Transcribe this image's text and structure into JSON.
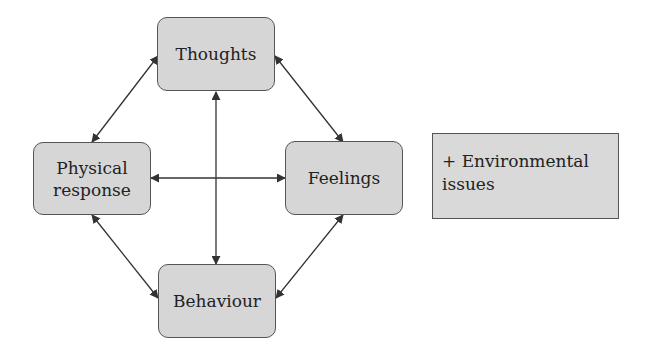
{
  "diagram": {
    "nodes": {
      "thoughts": {
        "label": "Thoughts"
      },
      "physical": {
        "label_line1": "Physical",
        "label_line2": "response"
      },
      "feelings": {
        "label": "Feelings"
      },
      "behaviour": {
        "label": "Behaviour"
      }
    },
    "side_note": {
      "line1": "+ Environmental",
      "line2": "issues"
    },
    "edges": [
      {
        "from": "Thoughts",
        "to": "Physical response",
        "bidirectional": true
      },
      {
        "from": "Thoughts",
        "to": "Feelings",
        "bidirectional": true
      },
      {
        "from": "Thoughts",
        "to": "Behaviour",
        "bidirectional": true
      },
      {
        "from": "Physical response",
        "to": "Feelings",
        "bidirectional": true
      },
      {
        "from": "Physical response",
        "to": "Behaviour",
        "bidirectional": true
      },
      {
        "from": "Feelings",
        "to": "Behaviour",
        "bidirectional": true
      }
    ],
    "colors": {
      "box_fill": "#d6d6d6",
      "box_border": "#555555",
      "arrow": "#333333",
      "text": "#222222"
    }
  }
}
